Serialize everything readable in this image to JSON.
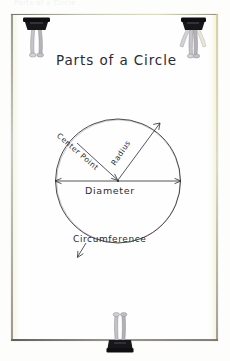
{
  "page": {
    "top_cropped_text": "Parts of a Circle",
    "paper_color": "#fefefe",
    "ink_color": "#2b2b33",
    "clip_color": "#1a1a1a",
    "clip_arm_color": "#b9b9bd",
    "paper_edge_tint": "#e2db96"
  },
  "diagram": {
    "title": "Parts of a Circle",
    "labels": {
      "center_point": "Center Point",
      "radius": "Radius",
      "diameter": "Diameter",
      "circumference": "Circumference"
    },
    "geometry": {
      "center_x": 118,
      "center_y": 181,
      "radius": 62,
      "diameter_line_y": 181,
      "diameter_left_x": 55,
      "diameter_right_x": 181,
      "radius_end_x": 160,
      "radius_end_y": 123,
      "center_point_arrow_from_x": 77,
      "center_point_arrow_from_y": 143,
      "circumference_arrow_from_x": 86,
      "circumference_arrow_from_y": 243,
      "circumference_arrow_to_x": 77,
      "circumference_arrow_to_y": 258
    }
  },
  "clips": [
    {
      "name": "top-left",
      "orientation": "down",
      "splay": "inward"
    },
    {
      "name": "top-right",
      "orientation": "down",
      "splay": "outward"
    },
    {
      "name": "bottom",
      "orientation": "up",
      "splay": "inward"
    }
  ]
}
